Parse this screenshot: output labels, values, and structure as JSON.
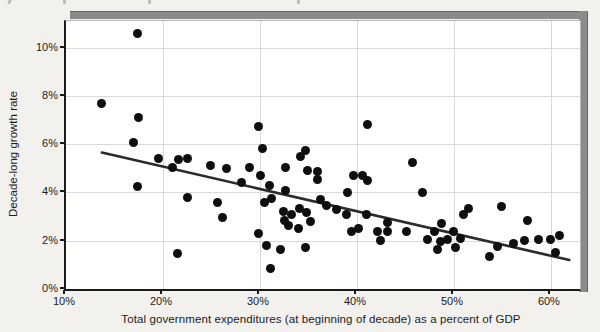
{
  "page": {
    "clipped_top_text_marks_x": [
      8,
      63,
      148,
      297
    ],
    "background": "#f2f1ee",
    "frame_shadow_color": "#8b8b8b"
  },
  "chart_data": {
    "type": "scatter",
    "title": "",
    "xlabel": "Total government expenditures (at beginning of decade) as a percent of GDP",
    "ylabel": "Decade-long growth rate",
    "x_ticks": [
      "10%",
      "20%",
      "30%",
      "40%",
      "50%",
      "60%"
    ],
    "x_tick_values": [
      10,
      20,
      30,
      40,
      50,
      60
    ],
    "y_ticks": [
      "0%",
      "2%",
      "4%",
      "6%",
      "8%",
      "10%"
    ],
    "y_tick_values": [
      0,
      2,
      4,
      6,
      8,
      10
    ],
    "xlim": [
      10,
      63
    ],
    "ylim": [
      0,
      11.1
    ],
    "grid": true,
    "legend": false,
    "point_color": "#0e0e0e",
    "trend_color": "#2b2b2b",
    "points": [
      [
        17.4,
        10.6
      ],
      [
        13.7,
        7.7
      ],
      [
        17.5,
        7.1
      ],
      [
        17.0,
        6.05
      ],
      [
        19.5,
        5.4
      ],
      [
        21.6,
        5.35
      ],
      [
        22.5,
        5.4
      ],
      [
        21.0,
        5.05
      ],
      [
        24.9,
        5.1
      ],
      [
        26.6,
        5.0
      ],
      [
        28.9,
        5.05
      ],
      [
        29.9,
        6.75
      ],
      [
        30.3,
        5.8
      ],
      [
        34.7,
        5.75
      ],
      [
        34.2,
        5.5
      ],
      [
        32.6,
        5.05
      ],
      [
        34.9,
        4.9
      ],
      [
        35.9,
        4.85
      ],
      [
        35.9,
        4.55
      ],
      [
        41.1,
        6.8
      ],
      [
        45.7,
        5.25
      ],
      [
        17.4,
        4.25
      ],
      [
        22.5,
        3.8
      ],
      [
        25.6,
        3.6
      ],
      [
        26.1,
        2.95
      ],
      [
        28.1,
        4.4
      ],
      [
        30.1,
        4.7
      ],
      [
        31.0,
        4.3
      ],
      [
        32.6,
        4.1
      ],
      [
        30.5,
        3.6
      ],
      [
        31.2,
        3.75
      ],
      [
        32.4,
        3.2
      ],
      [
        33.3,
        3.1
      ],
      [
        34.1,
        3.35
      ],
      [
        34.8,
        3.15
      ],
      [
        32.5,
        2.85
      ],
      [
        32.9,
        2.65
      ],
      [
        34.0,
        2.5
      ],
      [
        35.2,
        2.8
      ],
      [
        36.2,
        3.7
      ],
      [
        36.9,
        3.45
      ],
      [
        37.9,
        3.3
      ],
      [
        38.9,
        3.1
      ],
      [
        39.0,
        4.0
      ],
      [
        39.6,
        4.7
      ],
      [
        40.6,
        4.7
      ],
      [
        41.1,
        4.5
      ],
      [
        41.0,
        3.1
      ],
      [
        40.2,
        2.5
      ],
      [
        39.4,
        2.4
      ],
      [
        42.1,
        2.4
      ],
      [
        42.4,
        2.0
      ],
      [
        43.1,
        2.75
      ],
      [
        43.1,
        2.4
      ],
      [
        45.1,
        2.4
      ],
      [
        46.8,
        4.0
      ],
      [
        21.5,
        1.45
      ],
      [
        29.8,
        2.3
      ],
      [
        30.7,
        1.8
      ],
      [
        32.1,
        1.65
      ],
      [
        34.7,
        1.7
      ],
      [
        31.1,
        0.85
      ],
      [
        47.3,
        2.05
      ],
      [
        48.0,
        2.4
      ],
      [
        48.7,
        2.7
      ],
      [
        48.6,
        1.95
      ],
      [
        49.3,
        2.05
      ],
      [
        50.0,
        2.4
      ],
      [
        50.7,
        2.1
      ],
      [
        48.3,
        1.65
      ],
      [
        50.2,
        1.7
      ],
      [
        51.0,
        3.1
      ],
      [
        51.5,
        3.35
      ],
      [
        54.9,
        3.4
      ],
      [
        57.6,
        2.85
      ],
      [
        53.7,
        1.35
      ],
      [
        54.5,
        1.75
      ],
      [
        56.1,
        1.9
      ],
      [
        57.3,
        2.0
      ],
      [
        58.7,
        2.05
      ],
      [
        60.0,
        2.05
      ],
      [
        60.9,
        2.2
      ],
      [
        60.5,
        1.5
      ]
    ],
    "trend_line": {
      "x": [
        13.7,
        61.9
      ],
      "y": [
        5.65,
        1.2
      ]
    }
  }
}
